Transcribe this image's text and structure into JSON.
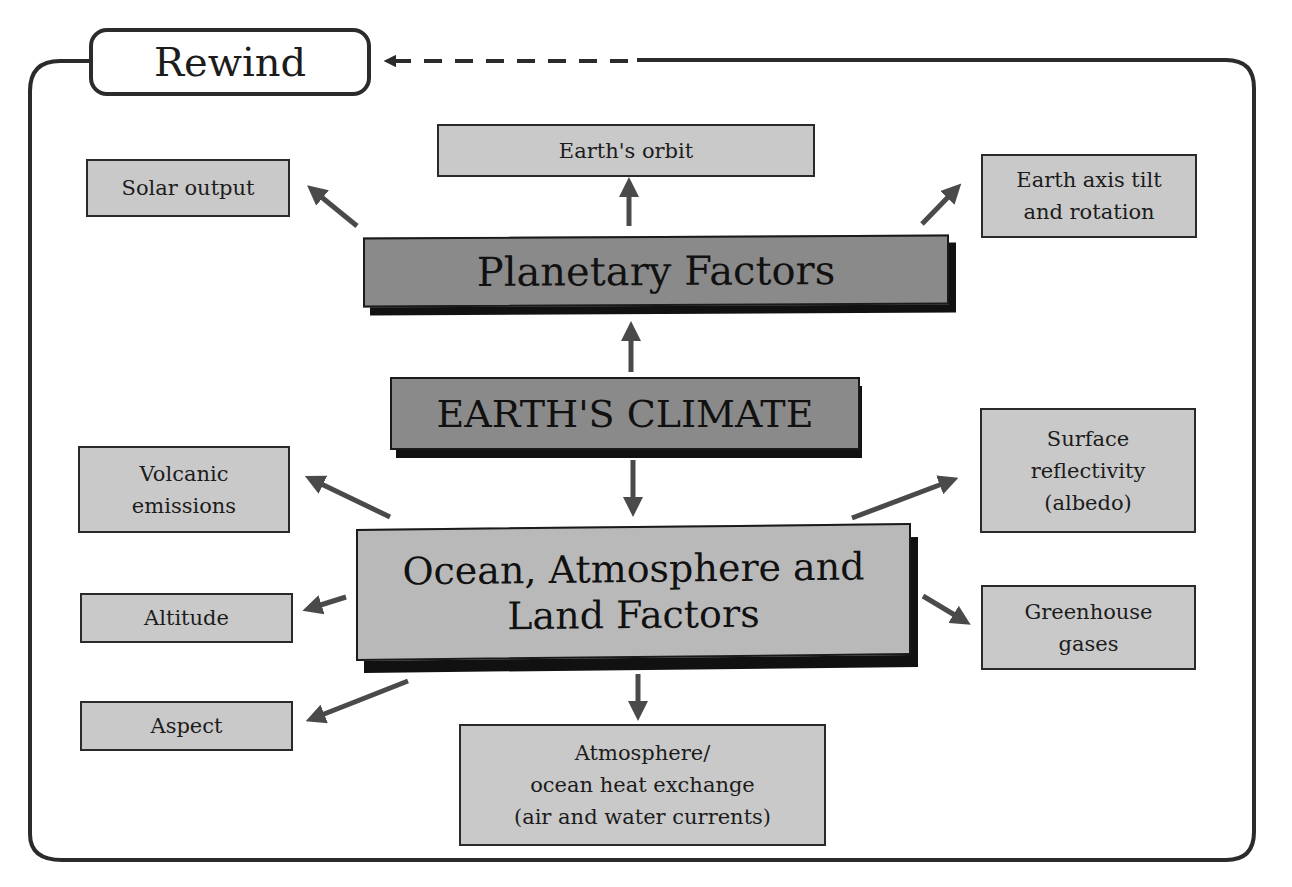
{
  "diagram": {
    "rewind_button": {
      "label": "Rewind",
      "icon": "arrow-left-icon"
    },
    "colors": {
      "frame": "#2b2b2b",
      "arrow": "#4a4a4a",
      "core_fill": "#8a8a8a",
      "ocean_fill": "#b9b9b9",
      "leaf_fill": "#c9c9c9",
      "shadow": "#111111"
    },
    "center": {
      "label": "EARTH'S CLIMATE"
    },
    "planetary": {
      "label": "Planetary Factors",
      "factors": [
        {
          "id": "solar-output",
          "lines": [
            "Solar output"
          ]
        },
        {
          "id": "earths-orbit",
          "lines": [
            "Earth's orbit"
          ]
        },
        {
          "id": "axis-tilt",
          "lines": [
            "Earth axis tilt",
            "and rotation"
          ]
        }
      ]
    },
    "ocean": {
      "lines": [
        "Ocean, Atmosphere and",
        "Land Factors"
      ],
      "factors": [
        {
          "id": "volcanic",
          "lines": [
            "Volcanic",
            "emissions"
          ]
        },
        {
          "id": "altitude",
          "lines": [
            "Altitude"
          ]
        },
        {
          "id": "aspect",
          "lines": [
            "Aspect"
          ]
        },
        {
          "id": "heat-exchange",
          "lines": [
            "Atmosphere/",
            "ocean heat exchange",
            "(air and water currents)"
          ]
        },
        {
          "id": "albedo",
          "lines": [
            "Surface",
            "reflectivity",
            "(albedo)"
          ]
        },
        {
          "id": "greenhouse",
          "lines": [
            "Greenhouse",
            "gases"
          ]
        }
      ]
    }
  }
}
